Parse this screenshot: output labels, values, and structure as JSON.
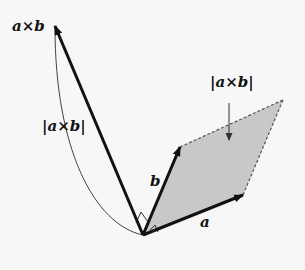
{
  "diagram": {
    "labels": {
      "cross_vector": "a×b",
      "cross_length": "|a×b|",
      "area_label": "|a×b|",
      "vector_a": "a",
      "vector_b": "b"
    },
    "colors": {
      "vectors": "#111111",
      "parallelogram_fill": "#c8c8c8",
      "dashed_edges": "#555555",
      "arc": "#444444",
      "background": "#f7f7f7"
    },
    "points": {
      "origin": [
        143,
        235
      ],
      "a_tip": [
        243,
        195
      ],
      "b_tip": [
        180,
        147
      ],
      "far_corner": [
        283,
        100
      ],
      "cross_tip": [
        55,
        25
      ]
    }
  }
}
